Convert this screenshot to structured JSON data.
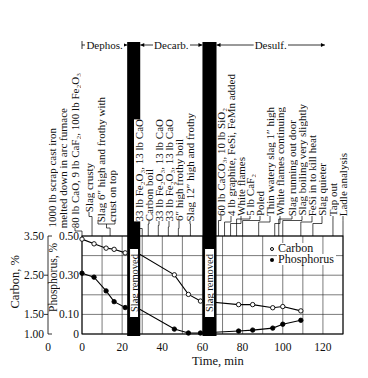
{
  "chart_data": {
    "type": "line",
    "title": "",
    "xlabel": "Time, min",
    "ylabel": "Carbon, %",
    "ylabel_secondary": "Phosphorus, %",
    "xlim": [
      0,
      130
    ],
    "x_ticks": [
      0,
      20,
      40,
      60,
      80,
      100,
      120
    ],
    "x_tick_labels": [
      "0",
      "20",
      "40",
      "60",
      "80",
      "100",
      "120"
    ],
    "grid": true,
    "grid_x_step": 10,
    "grid_y_step_phosphorus": 0.1,
    "carbon_axis": {
      "ylim": [
        1.0,
        3.5
      ],
      "ticks": [
        3.5,
        2.5,
        1.5,
        1.0
      ],
      "tick_labels": [
        "3.50",
        "2.50",
        "1.50",
        "1.00"
      ],
      "bottom_label": "0"
    },
    "phosphorus_axis": {
      "ylim": [
        0,
        0.5
      ],
      "ticks": [
        0.5,
        0.3,
        0.1,
        0
      ],
      "tick_labels": [
        "0.50",
        "0.30",
        "0.10",
        "0"
      ]
    },
    "legend": {
      "position": "upper right inside plot",
      "entries": [
        {
          "label": "Carbon",
          "marker": "open-circle"
        },
        {
          "label": "Phosphorus",
          "marker": "filled-circle"
        }
      ]
    },
    "series": [
      {
        "name": "Carbon",
        "axis": "carbon",
        "marker": "open-circle",
        "points": [
          [
            0,
            3.42
          ],
          [
            6,
            3.3
          ],
          [
            12,
            3.19
          ],
          [
            16,
            3.16
          ],
          [
            21.5,
            3.07
          ],
          [
            46,
            2.51
          ],
          [
            53,
            2.01
          ],
          [
            59,
            1.84
          ],
          [
            78,
            1.75
          ],
          [
            85,
            1.75
          ],
          [
            95,
            1.67
          ],
          [
            100,
            1.7
          ],
          [
            109,
            1.59
          ]
        ],
        "unmarked_vertices": [
          [
            29,
            3.03
          ]
        ]
      },
      {
        "name": "Phosphorus",
        "axis": "phosphorus",
        "marker": "filled-circle",
        "points": [
          [
            0,
            0.31
          ],
          [
            6,
            0.29
          ],
          [
            12,
            0.22
          ],
          [
            16,
            0.165
          ],
          [
            21.5,
            0.135
          ],
          [
            46,
            0.025
          ],
          [
            53,
            0.005
          ],
          [
            59,
            0.005
          ],
          [
            78,
            0.015
          ],
          [
            85,
            0.02
          ],
          [
            95,
            0.03
          ],
          [
            100,
            0.05
          ],
          [
            109,
            0.07
          ]
        ],
        "unmarked_vertices": [
          [
            29,
            0.125
          ]
        ]
      }
    ],
    "shaded_intervals": [
      {
        "label": "Slag removed",
        "start": 22.5,
        "end": 29
      },
      {
        "label": "Slag removed",
        "start": 60,
        "end": 67
      }
    ],
    "phases": [
      {
        "label": "Dephos.",
        "start": 0,
        "end": 22.5
      },
      {
        "label": "Decarb.",
        "start": 29,
        "end": 60
      },
      {
        "label": "Desulf.",
        "start": 67,
        "end": 121
      }
    ],
    "annotations": [
      {
        "lines": [
          "1000 lb scrap cast iron",
          "melted down in arc furnace",
          "80 lb CaO, 9 lb CaF₂, 100 lb Fe₂O₃"
        ],
        "time": 0
      },
      {
        "lines": [
          "Slag crusty"
        ],
        "time": 5
      },
      {
        "lines": [
          "Slag 6″ high and frothy with",
          "crust on top"
        ],
        "time": 14,
        "bracket": true
      },
      {
        "lines": [
          "33 lb Fe₂O₃, 13 lb CaO"
        ],
        "time": 30
      },
      {
        "lines": [
          "Carbon boil"
        ],
        "time": 33
      },
      {
        "lines": [
          "33 lb Fe₂O₃, 13 lb CaO"
        ],
        "time": 38
      },
      {
        "lines": [
          "33 lb Fe₂O₃, 13 lb CaO"
        ],
        "time": 43
      },
      {
        "lines": [
          "6″ high frothy boil"
        ],
        "time": 48
      },
      {
        "lines": [
          "Slag 12″ high and frothy"
        ],
        "time": 54
      },
      {
        "lines": [
          "60 lb CaCO₃, 10 lb SiO₂"
        ],
        "time": 68
      },
      {
        "lines": [
          "4 lb graphite, FeSi, FeMn added"
        ],
        "time": 71
      },
      {
        "lines": [
          "White flames"
        ],
        "time": 74
      },
      {
        "lines": [
          "5 lb CaF₂"
        ],
        "time": 77
      },
      {
        "lines": [
          "Poled"
        ],
        "time": 80
      },
      {
        "lines": [
          "Thin watery slag 1″ high"
        ],
        "time": 88
      },
      {
        "lines": [
          "White flames continuing"
        ],
        "time": 96
      },
      {
        "lines": [
          "Slag running out door"
        ],
        "time": 98
      },
      {
        "lines": [
          "Slag boiling very slightly"
        ],
        "time": 100
      },
      {
        "lines": [
          "FeSi in to kill heat"
        ],
        "time": 109
      },
      {
        "lines": [
          "Slag quieter"
        ],
        "time": 115
      },
      {
        "lines": [
          "Tap out"
        ],
        "time": 125
      },
      {
        "lines": [
          "Ladle analysis"
        ],
        "time": 130
      }
    ]
  }
}
